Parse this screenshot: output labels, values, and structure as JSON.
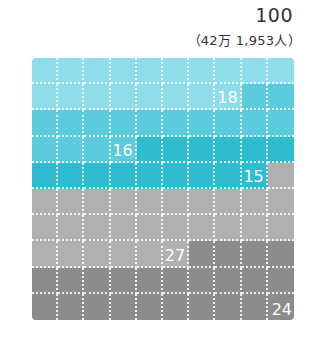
{
  "header": {
    "total": "100",
    "subtotal": "（42万 1,953人）"
  },
  "chart_data": {
    "type": "waffle",
    "grid": [
      10,
      10
    ],
    "total": 100,
    "total_label": "100",
    "subtitle": "（42万 1,953人）",
    "series": [
      {
        "name": "segment-1",
        "value": 18,
        "label": "18",
        "color": "#8fdcea"
      },
      {
        "name": "segment-2",
        "value": 16,
        "label": "16",
        "color": "#5ccbdd"
      },
      {
        "name": "segment-3",
        "value": 15,
        "label": "15",
        "color": "#2fbccf"
      },
      {
        "name": "segment-4",
        "value": 27,
        "label": "27",
        "color": "#b0b0b0"
      },
      {
        "name": "segment-5",
        "value": 24,
        "label": "24",
        "color": "#8c8c8c"
      }
    ],
    "fill_order": "row-major, top-left to bottom-right",
    "grid_lines": "white dotted"
  }
}
